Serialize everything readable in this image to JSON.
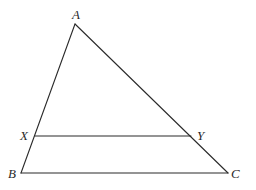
{
  "diagram": {
    "type": "triangle-with-parallel-segment",
    "points": {
      "A": {
        "x": 75,
        "y": 24
      },
      "B": {
        "x": 21,
        "y": 173
      },
      "C": {
        "x": 228,
        "y": 173
      },
      "X": {
        "x": 35,
        "y": 136
      },
      "Y": {
        "x": 191,
        "y": 136
      }
    },
    "segments": [
      {
        "from": "A",
        "to": "B"
      },
      {
        "from": "A",
        "to": "C"
      },
      {
        "from": "B",
        "to": "C"
      },
      {
        "from": "X",
        "to": "Y"
      }
    ],
    "labels": {
      "A": "A",
      "B": "B",
      "C": "C",
      "X": "X",
      "Y": "Y"
    },
    "label_positions": {
      "A": {
        "x": 72,
        "y": 19
      },
      "B": {
        "x": 8,
        "y": 178
      },
      "C": {
        "x": 231,
        "y": 178
      },
      "X": {
        "x": 20,
        "y": 140
      },
      "Y": {
        "x": 197,
        "y": 140
      }
    }
  }
}
